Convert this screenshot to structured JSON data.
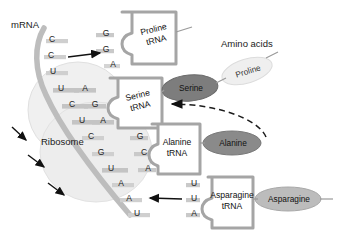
{
  "diagram": {
    "title_labels": {
      "mrna": "mRNA",
      "amino_acids": "Amino acids",
      "ribosome": "Ribosome"
    },
    "mrna_bases": [
      {
        "base": "C"
      },
      {
        "base": "C"
      },
      {
        "base": "U"
      },
      {
        "base": "U"
      },
      {
        "base": "C"
      },
      {
        "base": "U"
      },
      {
        "base": "C"
      },
      {
        "base": "G"
      },
      {
        "base": "U"
      },
      {
        "base": "A"
      },
      {
        "base": "A"
      },
      {
        "base": "U"
      }
    ],
    "trnas": [
      {
        "name": "Proline",
        "sub": "tRNA",
        "anticodon": [
          "G",
          "G",
          "A"
        ],
        "amino_acid": "Proline",
        "oval_color": "#ececec"
      },
      {
        "name": "Serine",
        "sub": "tRNA",
        "anticodon": [
          "A",
          "G",
          "A"
        ],
        "amino_acid": "Serine",
        "oval_color": "#7d7d7d"
      },
      {
        "name": "Alanine",
        "sub": "tRNA",
        "anticodon": [
          "G",
          "C",
          "A"
        ],
        "amino_acid": "Alanine",
        "oval_color": "#8a8a8a"
      },
      {
        "name": "Asparagine",
        "sub": "tRNA",
        "anticodon": [
          "U",
          "U",
          "A"
        ],
        "amino_acid": "Asparagine",
        "oval_color": "#b9b9b9"
      }
    ],
    "colors": {
      "background": "#ffffff",
      "mrna_strand": "#b9b9b9",
      "base_pair_band": "#c9c9c9",
      "trna_box_border": "#9e9e9e",
      "ribosome_fill": "#ededed",
      "arrow": "#111111",
      "text": "#1a1a1a"
    }
  }
}
